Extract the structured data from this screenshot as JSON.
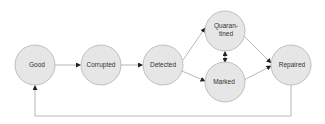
{
  "diagram": {
    "type": "state-machine",
    "colors": {
      "node_fill": "#e6e6e6",
      "node_stroke": "#b3b3b3",
      "edge": "#9a9a9a",
      "arrowhead": "#222222",
      "text": "#333333"
    },
    "nodes": [
      {
        "id": "good",
        "label": "Good",
        "cx": 35,
        "cy": 65,
        "r": 20
      },
      {
        "id": "corrupted",
        "label": "Corrupted",
        "cx": 101,
        "cy": 65,
        "r": 20
      },
      {
        "id": "detected",
        "label": "Detected",
        "cx": 163,
        "cy": 65,
        "r": 20
      },
      {
        "id": "quarantined",
        "label_line1": "Quaran-",
        "label_line2": "tined",
        "cx": 225,
        "cy": 31,
        "r": 20
      },
      {
        "id": "marked",
        "label": "Marked",
        "cx": 225,
        "cy": 82,
        "r": 20
      },
      {
        "id": "repaired",
        "label": "Repaired",
        "cx": 291,
        "cy": 65,
        "r": 20
      }
    ],
    "edges": [
      {
        "from": "good",
        "to": "corrupted"
      },
      {
        "from": "corrupted",
        "to": "detected"
      },
      {
        "from": "detected",
        "to": "quarantined"
      },
      {
        "from": "detected",
        "to": "marked"
      },
      {
        "from": "quarantined",
        "to": "marked",
        "bidirectional": true
      },
      {
        "from": "quarantined",
        "to": "repaired"
      },
      {
        "from": "marked",
        "to": "repaired"
      },
      {
        "from": "repaired",
        "to": "good",
        "routing": "loop-below"
      }
    ]
  }
}
